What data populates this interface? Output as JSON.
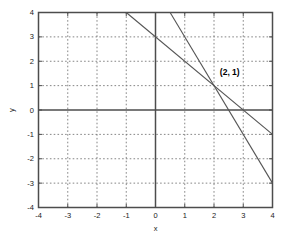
{
  "chart_data": {
    "type": "line",
    "title": "",
    "xlabel": "x",
    "ylabel": "y",
    "xlim": [
      -4,
      4
    ],
    "ylim": [
      -4,
      4
    ],
    "xticks": [
      -4,
      -3,
      -2,
      -1,
      0,
      1,
      2,
      3,
      4
    ],
    "yticks": [
      -4,
      -3,
      -2,
      -1,
      0,
      1,
      2,
      3,
      4
    ],
    "xticklabels": [
      "-4",
      "-3",
      "-2",
      "-1",
      "0",
      "1",
      "2",
      "3",
      "4"
    ],
    "yticklabels": [
      "-4",
      "-3",
      "-2",
      "-1",
      "0",
      "1",
      "2",
      "3",
      "4"
    ],
    "grid": true,
    "grid_style": "dotted",
    "legend": null,
    "series": [
      {
        "name": "line-1",
        "equation": "y = 3 - x",
        "slope": -1,
        "intercept": 3,
        "x": [
          -1,
          4
        ],
        "y": [
          4,
          -1
        ],
        "color": "#555555"
      },
      {
        "name": "line-2",
        "equation": "y = 5 - 2x",
        "slope": -2,
        "intercept": 5,
        "x": [
          0.5,
          4
        ],
        "y": [
          4,
          -3
        ],
        "color": "#555555"
      }
    ],
    "annotations": [
      {
        "label": "(2, 1)",
        "x": 2,
        "y": 1,
        "bold": true,
        "offset_x": 0.2,
        "offset_y": 0.45
      }
    ],
    "colors": {
      "axis": "#4d4d4d",
      "grid": "#777777",
      "line": "#555555",
      "text": "#1a1a1a",
      "background": "#ffffff"
    }
  }
}
